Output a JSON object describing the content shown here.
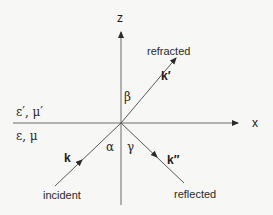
{
  "diagram": {
    "axes": {
      "x_label": "x",
      "z_label": "z"
    },
    "media": {
      "upper": "ε′, μ′",
      "lower": "ε, μ"
    },
    "rays": {
      "incident": {
        "label": "incident",
        "vector": "k",
        "angle": "α"
      },
      "refracted": {
        "label": "refracted",
        "vector": "k′",
        "angle": "β"
      },
      "reflected": {
        "label": "reflected",
        "vector": "k″",
        "angle": "γ"
      }
    },
    "colors": {
      "line": "#5a5a5a",
      "background": "#f7f7f5"
    }
  }
}
